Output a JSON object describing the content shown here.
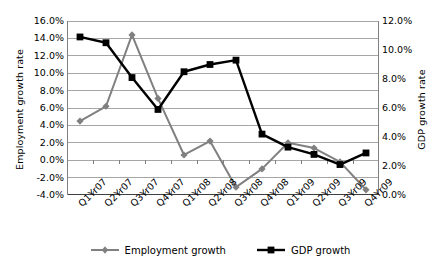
{
  "chart_data": {
    "type": "line",
    "title": "",
    "xlabel": "",
    "ylabel": "Employment growth rate",
    "y2label": "GDP growth rate",
    "grid": true,
    "legend_position": "bottom",
    "categories": [
      "Q1Yr07",
      "Q2Yr07",
      "Q3Yr07",
      "Q4Yr07",
      "Q1Yr08",
      "Q2Yr08",
      "Q3Yr08",
      "Q4Yr08",
      "Q1Yr09",
      "Q2Yr09",
      "Q3Yr09",
      "Q4Yr09"
    ],
    "ylim": [
      -4.0,
      16.0
    ],
    "ytick_step": 2.0,
    "yticks": [
      "16.0%",
      "14.0%",
      "12.0%",
      "10.0%",
      "8.0%",
      "6.0%",
      "4.0%",
      "2.0%",
      "0.0%",
      "-2.0%",
      "-4.0%"
    ],
    "ytick_values": [
      16.0,
      14.0,
      12.0,
      10.0,
      8.0,
      6.0,
      4.0,
      2.0,
      0.0,
      -2.0,
      -4.0
    ],
    "y2lim": [
      0.0,
      12.0
    ],
    "y2tick_step": 2.0,
    "y2ticks": [
      "12.0%",
      "10.0%",
      "8.0%",
      "6.0%",
      "4.0%",
      "2.0%",
      "0.0%"
    ],
    "y2tick_values": [
      12.0,
      10.0,
      8.0,
      6.0,
      4.0,
      2.0,
      0.0
    ],
    "series": [
      {
        "name": "Employment growth",
        "axis": "left",
        "color": "#808080",
        "marker": "diamond",
        "values": [
          4.5,
          6.2,
          14.4,
          7.1,
          0.6,
          2.2,
          -3.1,
          -1.0,
          2.0,
          1.4,
          -0.2,
          -3.4
        ]
      },
      {
        "name": "GDP growth",
        "axis": "right",
        "color": "#000000",
        "marker": "square",
        "values": [
          10.9,
          10.5,
          8.1,
          5.9,
          8.5,
          9.0,
          9.3,
          4.2,
          3.3,
          2.8,
          2.1,
          2.9
        ]
      }
    ]
  },
  "legend": {
    "items": [
      {
        "label": "Employment growth"
      },
      {
        "label": "GDP growth"
      }
    ]
  },
  "colors": {
    "employment": "#808080",
    "gdp": "#000000",
    "grid": "#a6a6a6",
    "axis": "#808080"
  }
}
